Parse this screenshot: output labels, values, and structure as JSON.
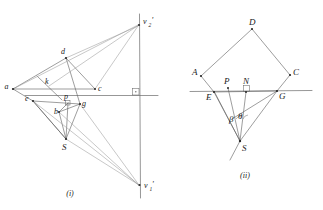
{
  "sheet": {
    "title": "Geometric construction figures (i) and (ii)",
    "background_color": "#ffffff",
    "line_color": "#5c5c5c",
    "faint_line_color": "#9a9a9a",
    "label_color": "#1a1a1a"
  },
  "captions": {
    "left": "(i)",
    "right": "(ii)"
  },
  "figure_i": {
    "caption": "(i)",
    "vertex_labels": {
      "a": "a",
      "c": "c",
      "d": "d",
      "k": "k",
      "e": "e",
      "b": "b",
      "p": "p",
      "g": "g",
      "S": "S"
    },
    "vanishing_point_upper": {
      "base": "v",
      "subscript": "2",
      "prime": "'",
      "full": "v2'"
    },
    "vanishing_point_lower": {
      "base": "v",
      "subscript": "1",
      "prime": "'",
      "full": "v1'"
    },
    "has_right_angle_mark": true,
    "points": {
      "a": [
        13,
        89
      ],
      "c": [
        95,
        89
      ],
      "d": [
        66,
        58
      ],
      "k": [
        49,
        86
      ],
      "e": [
        33,
        101
      ],
      "b": [
        59,
        112
      ],
      "p": [
        68,
        103
      ],
      "g": [
        80,
        104
      ],
      "S": [
        66,
        139
      ],
      "v2": [
        139,
        24
      ],
      "v1": [
        140,
        186
      ]
    }
  },
  "figure_ii": {
    "caption": "(ii)",
    "vertex_labels": {
      "A": "A",
      "C": "C",
      "D": "D",
      "E": "E",
      "G": "G",
      "N": "N",
      "P": "P",
      "S": "S"
    },
    "angle_labels": {
      "beta": "β",
      "theta": "θ"
    },
    "has_right_angle_mark": true,
    "points": {
      "A": [
        201,
        76
      ],
      "C": [
        290,
        75
      ],
      "D": [
        252,
        29
      ],
      "E": [
        214,
        92
      ],
      "G": [
        277,
        91
      ],
      "N": [
        246,
        92
      ],
      "P": [
        228,
        86
      ],
      "S": [
        240,
        141
      ],
      "beta_vertex": [
        234,
        117
      ],
      "theta_vertex": [
        243,
        116
      ]
    }
  }
}
